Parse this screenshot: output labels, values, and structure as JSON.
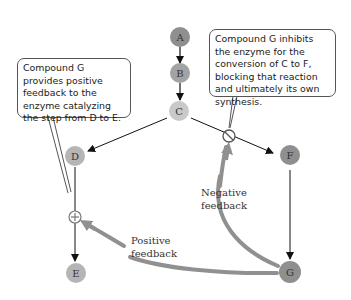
{
  "callouts": {
    "positive": "Compound G provides positive feedback to the enzyme catalyzing the step from D to E.",
    "negative": "Compound G inhibits the enzyme for the conversion of C to F, blocking that reaction and ultimately its own synthesis."
  },
  "nodes": {
    "A": "A",
    "B": "B",
    "C": "C",
    "D": "D",
    "E": "E",
    "F": "F",
    "G": "G"
  },
  "labels": {
    "negative_line1": "Negative",
    "negative_line2": "feedback",
    "positive_line1": "Positive",
    "positive_line2": "feedback"
  },
  "symbols": {
    "activator": "plus-circle",
    "inhibitor": "slash-circle"
  },
  "colors": {
    "node_dark": "#8f8f8f",
    "node_mid": "#a3a3a3",
    "node_light": "#c9c9c9",
    "feedback_arrow": "#909090",
    "line": "#222222"
  }
}
